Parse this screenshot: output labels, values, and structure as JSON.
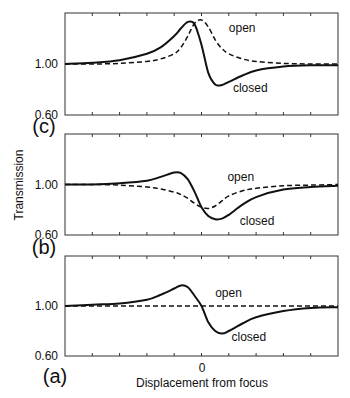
{
  "chart_data": [
    {
      "type": "line",
      "panel": "(c)",
      "xlabel": "",
      "ylabel": "",
      "yticks": [
        "1.00",
        "0.60"
      ],
      "ylim": [
        0.6,
        1.4
      ],
      "xlim": [
        -1.0,
        1.0
      ],
      "grid": false,
      "series": [
        {
          "name": "closed",
          "style": "solid",
          "x": [
            -1.0,
            -0.8,
            -0.6,
            -0.4,
            -0.3,
            -0.2,
            -0.15,
            -0.1,
            -0.05,
            0.0,
            0.05,
            0.1,
            0.15,
            0.2,
            0.3,
            0.4,
            0.6,
            0.8,
            1.0
          ],
          "y": [
            1.0,
            1.01,
            1.03,
            1.08,
            1.13,
            1.22,
            1.28,
            1.33,
            1.31,
            1.15,
            0.93,
            0.84,
            0.835,
            0.86,
            0.91,
            0.95,
            0.98,
            0.99,
            0.99
          ]
        },
        {
          "name": "open",
          "style": "dashed",
          "x": [
            -1.0,
            -0.8,
            -0.6,
            -0.4,
            -0.3,
            -0.2,
            -0.15,
            -0.1,
            -0.05,
            0.0,
            0.05,
            0.1,
            0.15,
            0.2,
            0.3,
            0.4,
            0.6,
            0.8,
            1.0
          ],
          "y": [
            1.0,
            1.0,
            1.005,
            1.02,
            1.04,
            1.08,
            1.13,
            1.22,
            1.32,
            1.345,
            1.29,
            1.19,
            1.12,
            1.08,
            1.04,
            1.02,
            1.005,
            1.0,
            1.0
          ]
        }
      ],
      "annotations": [
        {
          "text": "open",
          "x": 0.2,
          "y": 1.25
        },
        {
          "text": "closed",
          "x": 0.23,
          "y": 0.78
        }
      ]
    },
    {
      "type": "line",
      "panel": "(b)",
      "xlabel": "",
      "ylabel": "Transmission",
      "yticks": [
        "1.00",
        "0.60"
      ],
      "ylim": [
        0.6,
        1.4
      ],
      "xlim": [
        -1.0,
        1.0
      ],
      "grid": false,
      "series": [
        {
          "name": "closed",
          "style": "solid",
          "x": [
            -1.0,
            -0.8,
            -0.6,
            -0.4,
            -0.3,
            -0.2,
            -0.15,
            -0.1,
            -0.05,
            0.0,
            0.05,
            0.1,
            0.15,
            0.2,
            0.3,
            0.4,
            0.6,
            0.8,
            1.0
          ],
          "y": [
            1.0,
            1.0,
            1.01,
            1.03,
            1.06,
            1.094,
            1.09,
            1.04,
            0.94,
            0.82,
            0.75,
            0.725,
            0.73,
            0.76,
            0.84,
            0.9,
            0.96,
            0.98,
            0.99
          ]
        },
        {
          "name": "open",
          "style": "dashed",
          "x": [
            -1.0,
            -0.8,
            -0.6,
            -0.4,
            -0.3,
            -0.2,
            -0.15,
            -0.1,
            -0.05,
            0.0,
            0.05,
            0.1,
            0.15,
            0.2,
            0.3,
            0.4,
            0.6,
            0.8,
            1.0
          ],
          "y": [
            1.0,
            1.0,
            0.995,
            0.98,
            0.965,
            0.94,
            0.92,
            0.89,
            0.85,
            0.82,
            0.81,
            0.83,
            0.87,
            0.91,
            0.95,
            0.97,
            0.99,
            0.995,
            1.0
          ]
        }
      ],
      "annotations": [
        {
          "text": "open",
          "x": 0.19,
          "y": 1.03
        },
        {
          "text": "closed",
          "x": 0.28,
          "y": 0.68
        }
      ]
    },
    {
      "type": "line",
      "panel": "(a)",
      "xlabel": "Displacement from focus",
      "ylabel": "",
      "xticks": [
        "0"
      ],
      "yticks": [
        "1.00",
        "0.60"
      ],
      "ylim": [
        0.6,
        1.4
      ],
      "xlim": [
        -1.0,
        1.0
      ],
      "grid": false,
      "series": [
        {
          "name": "closed",
          "style": "solid",
          "x": [
            -1.0,
            -0.8,
            -0.6,
            -0.4,
            -0.3,
            -0.2,
            -0.15,
            -0.1,
            -0.05,
            0.0,
            0.05,
            0.1,
            0.15,
            0.2,
            0.3,
            0.4,
            0.6,
            0.8,
            1.0
          ],
          "y": [
            1.0,
            1.01,
            1.02,
            1.05,
            1.09,
            1.14,
            1.165,
            1.15,
            1.08,
            1.0,
            0.87,
            0.8,
            0.78,
            0.8,
            0.86,
            0.91,
            0.96,
            0.985,
            0.99
          ]
        },
        {
          "name": "open",
          "style": "dashed",
          "x": [
            -1.0,
            1.0
          ],
          "y": [
            1.0,
            1.0
          ]
        }
      ],
      "annotations": [
        {
          "text": "open",
          "x": 0.1,
          "y": 1.07
        },
        {
          "text": "closed",
          "x": 0.22,
          "y": 0.72
        }
      ]
    }
  ],
  "labels": {
    "panel_c": "(c)",
    "panel_b": "(b)",
    "panel_a": "(a)",
    "ytick_top": "1.00",
    "ytick_bottom": "0.60",
    "ylabel": "Transmission",
    "xlabel": "Displacement from focus",
    "xtick_zero": "0",
    "series_open": "open",
    "series_closed": "closed"
  }
}
